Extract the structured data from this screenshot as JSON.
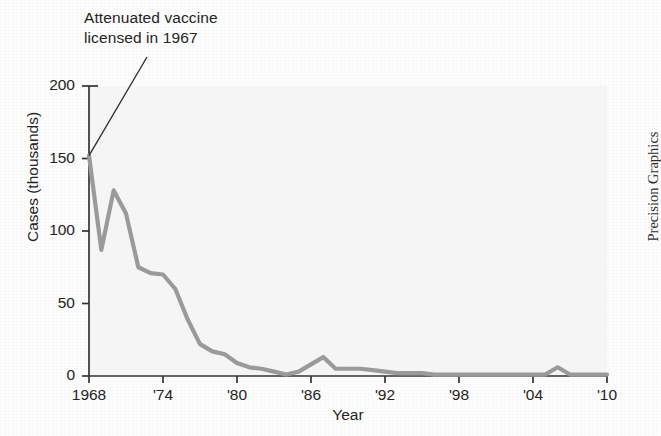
{
  "figure": {
    "credit": "Precision Graphics",
    "annotation": "Attenuated vaccine\nlicensed in 1967"
  },
  "chart_data": {
    "type": "line",
    "title": "",
    "xlabel": "Year",
    "ylabel": "Cases (thousands)",
    "xlim": [
      1968,
      2010
    ],
    "ylim": [
      0,
      200
    ],
    "grid": false,
    "legend": null,
    "line_color": "#9a9a9a",
    "axis_color": "#333333",
    "xtick_values": [
      1968,
      1974,
      1980,
      1986,
      1992,
      1998,
      2004,
      2010
    ],
    "xtick_labels": [
      "1968",
      "'74",
      "'80",
      "'86",
      "'92",
      "'98",
      "'04",
      "'10"
    ],
    "ytick_values": [
      0,
      50,
      100,
      150,
      200
    ],
    "ytick_labels": [
      "0",
      "50",
      "100",
      "150",
      "200"
    ],
    "annotations": [
      {
        "text": "Attenuated vaccine licensed in 1967",
        "points_to_x": 1968,
        "points_to_y": 152
      }
    ],
    "series": [
      {
        "name": "Mumps cases",
        "x": [
          1968,
          1969,
          1970,
          1971,
          1972,
          1973,
          1974,
          1975,
          1976,
          1977,
          1978,
          1979,
          1980,
          1981,
          1982,
          1983,
          1984,
          1985,
          1986,
          1987,
          1988,
          1989,
          1990,
          1991,
          1992,
          1993,
          1994,
          1995,
          1996,
          1997,
          1998,
          1999,
          2000,
          2001,
          2002,
          2003,
          2004,
          2005,
          2006,
          2007,
          2008,
          2009,
          2010
        ],
        "values": [
          152,
          87,
          128,
          112,
          75,
          71,
          70,
          60,
          39,
          22,
          17,
          15,
          9,
          6,
          5,
          3,
          1,
          3,
          8,
          13,
          5,
          5,
          5,
          4,
          3,
          2,
          2,
          2,
          1,
          1,
          1,
          1,
          1,
          1,
          1,
          1,
          1,
          1,
          6,
          1,
          1,
          1,
          1
        ]
      }
    ]
  }
}
